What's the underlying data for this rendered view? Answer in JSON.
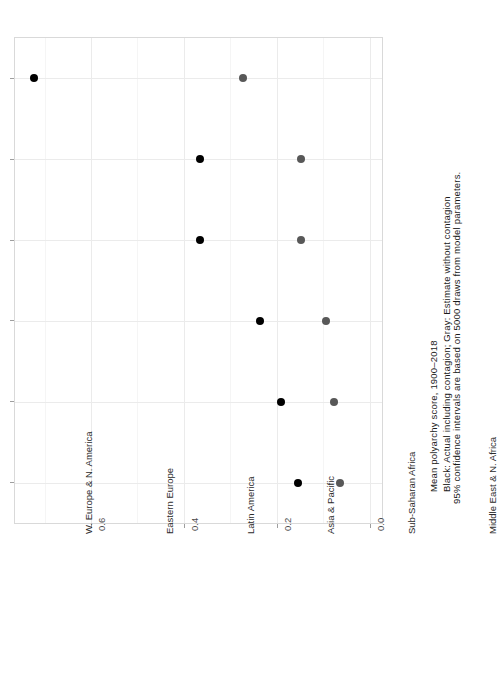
{
  "chart_data": {
    "type": "scatter",
    "orientation": "horizontal",
    "title": "",
    "xlabel": "",
    "ylabel": "Mean polyarchy score, 1900-2018",
    "axis_label": "Mean polyarchy score, 1900–2018",
    "caption_lines": [
      "Black: Actual including contagion; Gray: Estimate without contagion",
      "95% confidence intervals are based on 5000 draws from model parameters."
    ],
    "categories": [
      "W. Europe & N. America",
      "Eastern Europe",
      "Latin America",
      "Asia & Pacific",
      "Sub-Saharan Africa",
      "Middle East & N. Africa"
    ],
    "ylim": [
      -0.0265,
      0.7635
    ],
    "ticks": [
      "0.0",
      "0.2",
      "0.4",
      "0.6"
    ],
    "tick_values": [
      0.0,
      0.2,
      0.4,
      0.6
    ],
    "grid": true,
    "legend": "none",
    "series": [
      {
        "name": "Black: Actual including contagion",
        "color": "#000000",
        "values": [
          0.722,
          0.366,
          0.366,
          0.236,
          0.19,
          0.155
        ]
      },
      {
        "name": "Gray: Estimate without contagion",
        "color": "#585858",
        "values": [
          0.272,
          0.148,
          0.148,
          0.093,
          0.077,
          0.063
        ],
        "ci_low": [
          0.035,
          0.015,
          0.015,
          0.012,
          0.01,
          0.01
        ],
        "ci_high": [
          0.466,
          0.272,
          0.272,
          0.169,
          0.143,
          0.119
        ]
      }
    ]
  },
  "axis": {
    "value_axis_label": "Mean polyarchy score, 1900–2018",
    "tick_labels": [
      "0.0",
      "0.2",
      "0.4",
      "0.6"
    ],
    "category_labels": [
      "W. Europe & N. America",
      "Eastern Europe",
      "Latin America",
      "Asia & Pacific",
      "Sub-Saharan Africa",
      "Middle East & N. Africa"
    ]
  },
  "caption": {
    "line1": "Black: Actual including contagion; Gray: Estimate without contagion",
    "line2": "95% confidence intervals are based on 5000 draws from model parameters."
  },
  "colors": {
    "actual": "#000000",
    "estimate": "#585858",
    "panel_border": "#d9d9d9",
    "grid_major": "#ebebeb",
    "grid_minor": "#f5f5f5",
    "background": "#ffffff"
  }
}
